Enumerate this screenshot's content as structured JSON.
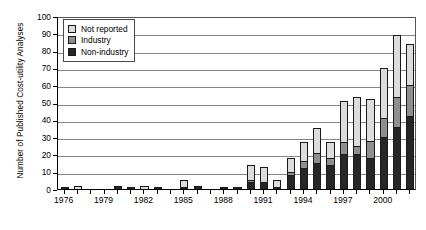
{
  "chart_data": {
    "type": "bar",
    "subtype": "stacked-column",
    "title": "",
    "xlabel": "",
    "ylabel": "Number of Published Cost-utility Analyses",
    "ylim": [
      0,
      100
    ],
    "ytick_step": 10,
    "yticks": [
      0,
      10,
      20,
      30,
      40,
      50,
      60,
      70,
      80,
      90,
      100
    ],
    "grid": "horizontal",
    "legend_position": "top-left",
    "categories": [
      "1976",
      "1977",
      "1978",
      "1979",
      "1980",
      "1981",
      "1982",
      "1983",
      "1984",
      "1985",
      "1986",
      "1987",
      "1988",
      "1989",
      "1990",
      "1991",
      "1992",
      "1993",
      "1994",
      "1995",
      "1996",
      "1997",
      "1998",
      "1999",
      "2000",
      "2001",
      "2002"
    ],
    "xtick_labels": [
      "1976",
      "1979",
      "1982",
      "1985",
      "1988",
      "1991",
      "1994",
      "1997",
      "2000"
    ],
    "series": [
      {
        "name": "Non-industry",
        "color": "#262626",
        "values": [
          1,
          0,
          0,
          0,
          2,
          1,
          0,
          1,
          0,
          1,
          2,
          0,
          1,
          1,
          4,
          4,
          1,
          8,
          12,
          15,
          14,
          20,
          20,
          18,
          30,
          36,
          42
        ]
      },
      {
        "name": "Industry",
        "color": "#8f8f8f",
        "values": [
          0,
          0,
          0,
          0,
          0,
          0,
          0,
          0,
          0,
          0,
          0,
          0,
          0,
          0,
          1,
          0,
          0,
          2,
          4,
          6,
          4,
          7,
          5,
          10,
          11,
          17,
          18
        ]
      },
      {
        "name": "Not reported",
        "color": "#dcdcdc",
        "values": [
          0,
          2,
          0,
          0,
          0,
          0,
          2,
          0,
          0,
          4,
          0,
          0,
          0,
          0,
          9,
          9,
          4,
          8,
          11,
          14,
          9,
          24,
          28,
          24,
          29,
          36,
          24
        ]
      }
    ],
    "totals": [
      1,
      2,
      0,
      0,
      2,
      1,
      2,
      1,
      0,
      5,
      2,
      0,
      1,
      1,
      14,
      13,
      5,
      18,
      27,
      35,
      27,
      51,
      53,
      52,
      70,
      89,
      84
    ]
  },
  "legend": {
    "items": [
      {
        "label": "Not reported",
        "key": "notrep"
      },
      {
        "label": "Industry",
        "key": "ind"
      },
      {
        "label": "Non-industry",
        "key": "nonind"
      }
    ]
  }
}
